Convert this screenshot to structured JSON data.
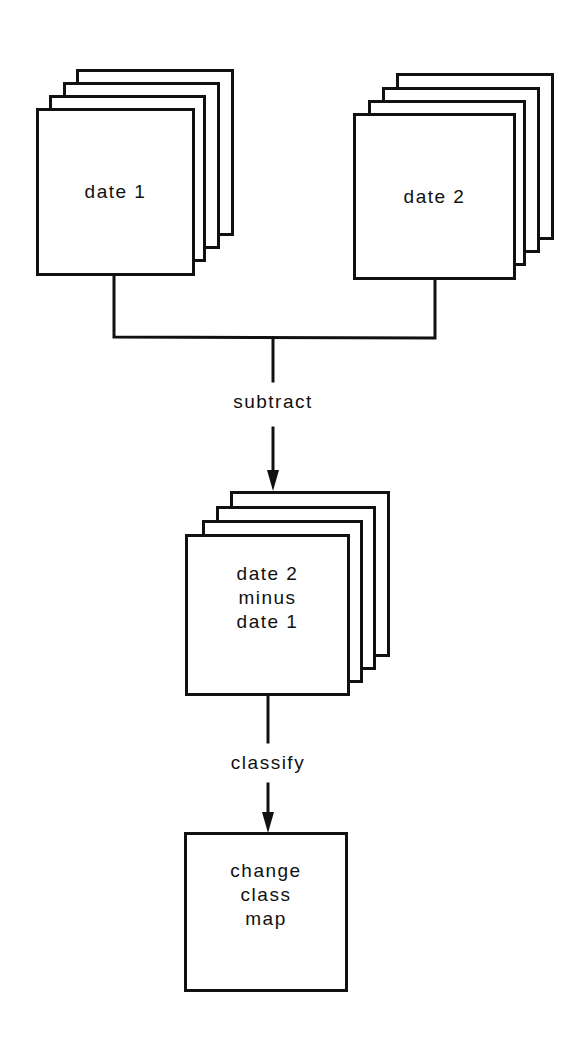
{
  "diagram": {
    "type": "flowchart",
    "line_color": "#111111",
    "background": "#ffffff",
    "nodes": {
      "date1": {
        "label": "date 1",
        "layers": 4
      },
      "date2": {
        "label": "date 2",
        "layers": 4
      },
      "difference": {
        "line1": "date 2",
        "line2": "minus",
        "line3": "date 1",
        "layers": 4
      },
      "result": {
        "line1": "change",
        "line2": "class",
        "line3": "map",
        "layers": 1
      }
    },
    "edges": {
      "subtract": {
        "label": "subtract",
        "from": [
          "date1",
          "date2"
        ],
        "to": "difference"
      },
      "classify": {
        "label": "classify",
        "from": "difference",
        "to": "result"
      }
    }
  }
}
